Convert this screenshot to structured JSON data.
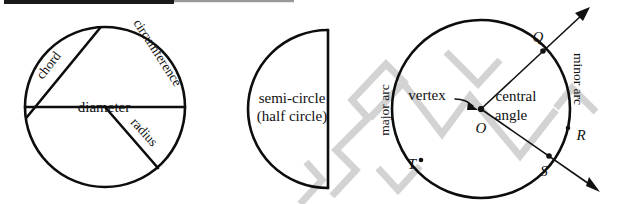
{
  "figure": {
    "background_color": "#ffffff",
    "ink_color": "#111111",
    "watermark_color": "#cfcfcf",
    "width": 618,
    "height": 204
  },
  "diagram1": {
    "name": "labeled-circle",
    "labels": {
      "circumference": "circumference",
      "chord": "chord",
      "diameter": "diameter",
      "radius": "radius"
    }
  },
  "diagram2": {
    "name": "semi-circle",
    "labels": {
      "line1": "semi-circle",
      "line2": "(half circle)"
    }
  },
  "diagram3": {
    "name": "central-angle-circle",
    "labels": {
      "major_arc": "major arc",
      "minor_arc": "minor arc",
      "vertex": "vertex",
      "central": "central",
      "angle": "angle"
    },
    "points": {
      "center": "O",
      "q": "Q",
      "r": "R",
      "s": "S",
      "t": "T"
    }
  }
}
